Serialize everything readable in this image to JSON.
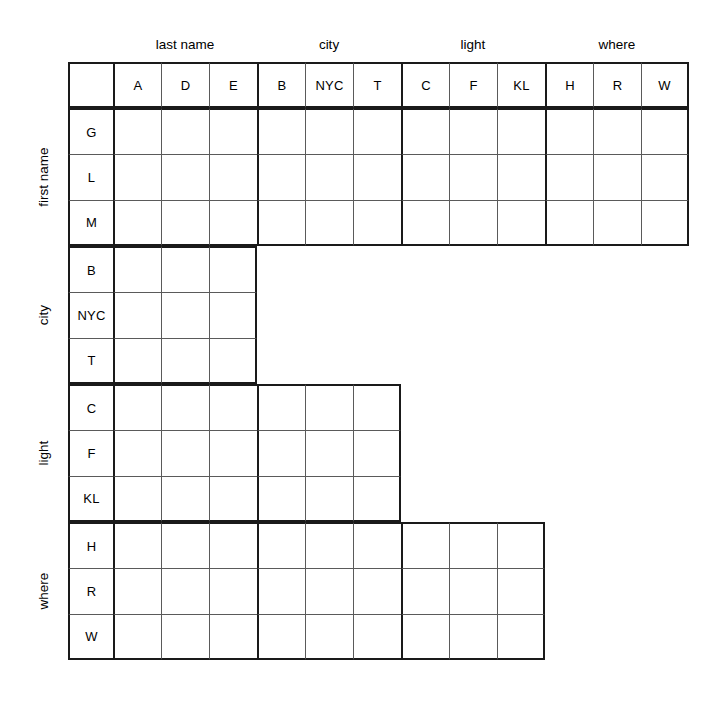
{
  "puzzle": {
    "type": "logic-grid",
    "column_groups": [
      {
        "label": "last name",
        "items": [
          "A",
          "D",
          "E"
        ]
      },
      {
        "label": "city",
        "items": [
          "B",
          "NYC",
          "T"
        ]
      },
      {
        "label": "light",
        "items": [
          "C",
          "F",
          "KL"
        ]
      },
      {
        "label": "where",
        "items": [
          "H",
          "R",
          "W"
        ]
      }
    ],
    "row_groups": [
      {
        "label": "first name",
        "items": [
          "G",
          "L",
          "M"
        ],
        "spans_column_groups": 4
      },
      {
        "label": "city",
        "items": [
          "B",
          "NYC",
          "T"
        ],
        "spans_column_groups": 1
      },
      {
        "label": "light",
        "items": [
          "C",
          "F",
          "KL"
        ],
        "spans_column_groups": 2
      },
      {
        "label": "where",
        "items": [
          "H",
          "R",
          "W"
        ],
        "spans_column_groups": 3
      }
    ],
    "cell_contents": [
      [
        "",
        "",
        "",
        "",
        "",
        "",
        "",
        "",
        "",
        "",
        "",
        ""
      ],
      [
        "",
        "",
        "",
        "",
        "",
        "",
        "",
        "",
        "",
        "",
        "",
        ""
      ],
      [
        "",
        "",
        "",
        "",
        "",
        "",
        "",
        "",
        "",
        "",
        "",
        ""
      ],
      [
        "",
        "",
        ""
      ],
      [
        "",
        "",
        ""
      ],
      [
        "",
        "",
        ""
      ],
      [
        "",
        "",
        "",
        "",
        "",
        ""
      ],
      [
        "",
        "",
        "",
        "",
        "",
        ""
      ],
      [
        "",
        "",
        "",
        "",
        "",
        ""
      ],
      [
        "",
        "",
        "",
        "",
        "",
        "",
        "",
        "",
        ""
      ],
      [
        "",
        "",
        "",
        "",
        "",
        "",
        "",
        "",
        ""
      ],
      [
        "",
        "",
        "",
        "",
        "",
        "",
        "",
        "",
        ""
      ]
    ],
    "colors": {
      "grid_thin": "#5a5a5a",
      "grid_thick": "#1a1a1a",
      "background": "#ffffff",
      "text": "#000000"
    }
  }
}
